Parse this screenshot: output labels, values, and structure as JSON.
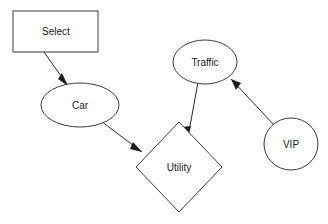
{
  "diagram": {
    "background_color": "#ffffff",
    "stroke_color": "#3b3b3b",
    "label_color": "#1a1a1a",
    "nodes": [
      {
        "id": "select",
        "label": "Select",
        "shape": "rectangle",
        "x": 13,
        "y": 11,
        "width": 85,
        "height": 41,
        "label_x": 56,
        "label_y": 32
      },
      {
        "id": "car",
        "label": "Car",
        "shape": "ellipse",
        "cx": 80,
        "cy": 105,
        "rx": 39,
        "ry": 22,
        "label_x": 80,
        "label_y": 106
      },
      {
        "id": "utility",
        "label": "Utility",
        "shape": "diamond",
        "cx": 179,
        "cy": 167,
        "rx": 43,
        "ry": 45,
        "label_x": 179,
        "label_y": 168
      },
      {
        "id": "traffic",
        "label": "Traffic",
        "shape": "ellipse",
        "cx": 205,
        "cy": 62,
        "rx": 32,
        "ry": 22,
        "label_x": 205,
        "label_y": 63
      },
      {
        "id": "vip",
        "label": "VIP",
        "shape": "circle",
        "cx": 291,
        "cy": 144,
        "rx": 27,
        "ry": 26,
        "label_x": 291,
        "label_y": 145
      }
    ],
    "edges": [
      {
        "id": "select-to-car",
        "from": "select",
        "to": "car",
        "label": "",
        "directed": true,
        "x1": 44,
        "y1": 52,
        "x2": 68,
        "y2": 86,
        "head_points": "68,86 58,79 62,73"
      },
      {
        "id": "car-to-utility",
        "from": "car",
        "to": "utility",
        "label": "",
        "directed": true,
        "x1": 101,
        "y1": 121,
        "x2": 142,
        "y2": 152,
        "head_points": "142,152 130,149 133,142"
      },
      {
        "id": "traffic-to-utility",
        "from": "traffic",
        "to": "utility",
        "label": "",
        "directed": true,
        "x1": 198,
        "y1": 82,
        "x2": 188,
        "y2": 137,
        "head_points": "188,137 182,127 191,126"
      },
      {
        "id": "vip-to-traffic",
        "from": "vip",
        "to": "traffic",
        "label": "",
        "directed": true,
        "x1": 274,
        "y1": 125,
        "x2": 231,
        "y2": 79,
        "head_points": "231,79 241,83 236,90"
      }
    ]
  }
}
